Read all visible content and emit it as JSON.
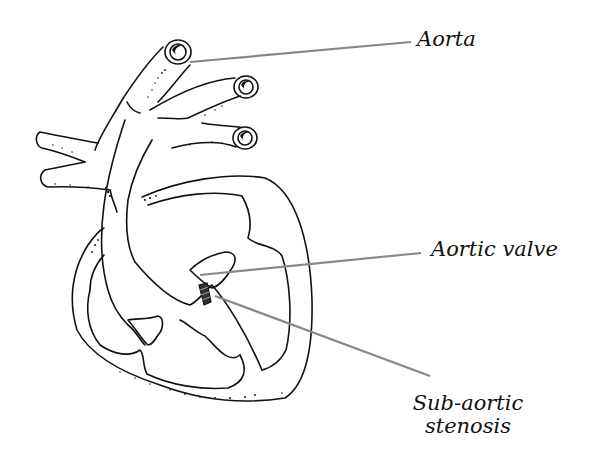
{
  "diagram": {
    "type": "anatomical-illustration",
    "labels": [
      {
        "id": "aorta",
        "text": "Aorta"
      },
      {
        "id": "aortic_valve",
        "text": "Aortic valve"
      },
      {
        "id": "sub_aortic_stenosis",
        "line1": "Sub-aortic",
        "line2": "stenosis"
      }
    ],
    "colors": {
      "ink": "#111111",
      "leader_line": "#888888",
      "background": "#ffffff"
    }
  }
}
